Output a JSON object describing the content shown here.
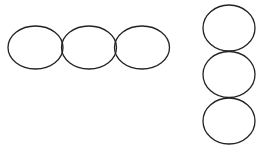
{
  "diagram": {
    "stroke_color": "#222222",
    "fill_color": "#ffffff",
    "horizontal_group": {
      "count": 3,
      "ellipses": [
        {
          "cx": 35.5,
          "cy": 47.5,
          "rx": 27.5,
          "ry": 21.5
        },
        {
          "cx": 89,
          "cy": 47.5,
          "rx": 27.5,
          "ry": 21.5
        },
        {
          "cx": 142,
          "cy": 47.5,
          "rx": 27.5,
          "ry": 21.5
        }
      ]
    },
    "vertical_group": {
      "count": 3,
      "ellipses": [
        {
          "cx": 229,
          "cy": 28,
          "rx": 26,
          "ry": 23
        },
        {
          "cx": 229,
          "cy": 74.5,
          "rx": 26,
          "ry": 23
        },
        {
          "cx": 229,
          "cy": 121,
          "rx": 26,
          "ry": 23
        }
      ]
    }
  }
}
